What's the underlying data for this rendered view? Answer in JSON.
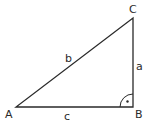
{
  "diagram": {
    "type": "right-triangle",
    "vertices": {
      "A": {
        "label": "A",
        "x": 16,
        "y": 107
      },
      "B": {
        "label": "B",
        "x": 133,
        "y": 107
      },
      "C": {
        "label": "C",
        "x": 133,
        "y": 18
      }
    },
    "sides": {
      "a": {
        "label": "a",
        "between": [
          "B",
          "C"
        ]
      },
      "b": {
        "label": "b",
        "between": [
          "A",
          "C"
        ]
      },
      "c": {
        "label": "c",
        "between": [
          "A",
          "B"
        ]
      }
    },
    "right_angle_at": "B",
    "stroke_color": "#2a2a2a"
  }
}
